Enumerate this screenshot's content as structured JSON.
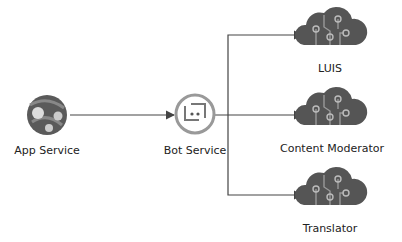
{
  "diagram": {
    "nodes": [
      {
        "id": "app-service",
        "label": "App Service",
        "icon": "app-service-icon"
      },
      {
        "id": "bot-service",
        "label": "Bot Service",
        "icon": "bot-icon"
      },
      {
        "id": "luis",
        "label": "LUIS",
        "icon": "cognitive-cloud-icon"
      },
      {
        "id": "content-moderator",
        "label": "Content Moderator",
        "icon": "cognitive-cloud-icon"
      },
      {
        "id": "translator",
        "label": "Translator",
        "icon": "cognitive-cloud-icon"
      }
    ],
    "edges": [
      {
        "from": "app-service",
        "to": "bot-service"
      },
      {
        "from": "bot-service",
        "to": "luis"
      },
      {
        "from": "bot-service",
        "to": "content-moderator"
      },
      {
        "from": "bot-service",
        "to": "translator"
      }
    ],
    "colors": {
      "line": "#444444",
      "icon": "#555555",
      "bot_ring": "#999999"
    }
  }
}
